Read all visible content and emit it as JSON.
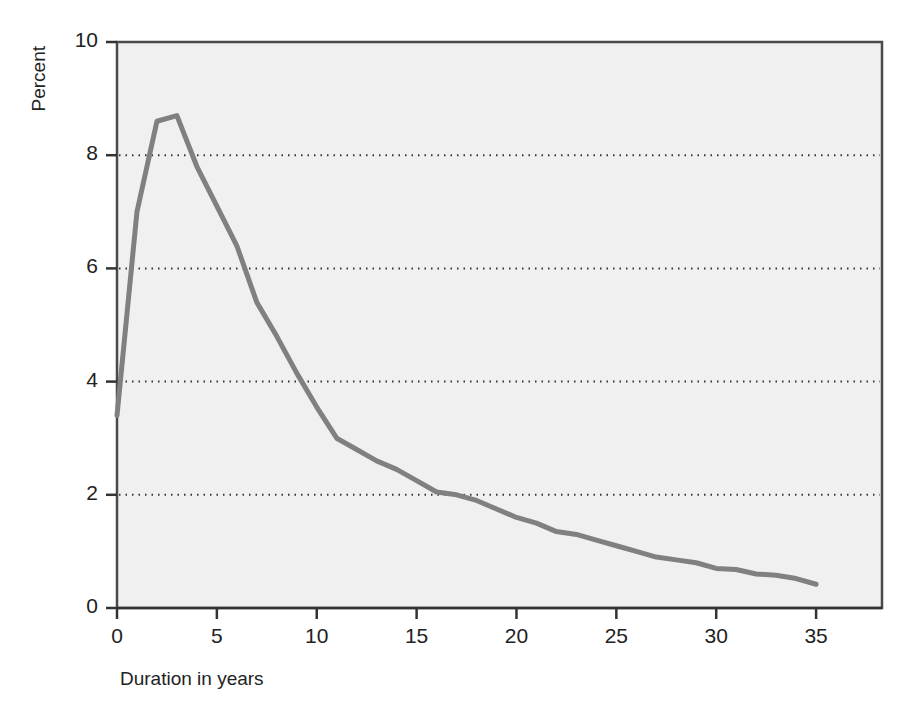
{
  "chart_data": {
    "type": "line",
    "title": "",
    "subtitle": "",
    "xlabel": "Duration in years",
    "ylabel": "Percent",
    "xlim": [
      0,
      38.3
    ],
    "ylim": [
      0,
      10
    ],
    "xticks": [
      0,
      5,
      10,
      15,
      20,
      25,
      30,
      35
    ],
    "xtick_labels": [
      "0",
      "5",
      "10",
      "15",
      "20",
      "25",
      "30",
      "35"
    ],
    "yticks": [
      0,
      2,
      4,
      6,
      8,
      10
    ],
    "ytick_labels": [
      "0",
      "2",
      "4",
      "6",
      "8",
      "10"
    ],
    "gridlines_y": [
      2,
      4,
      6,
      8
    ],
    "grid": "horizontal-dotted",
    "legend": "none",
    "plot_background": "#f0f0f0",
    "line_color": "#808080",
    "line_width": 5,
    "frame_color": "#4a4a4a",
    "x": [
      0,
      1,
      2,
      3,
      4,
      5,
      6,
      7,
      8,
      9,
      10,
      11,
      12,
      13,
      14,
      15,
      16,
      17,
      18,
      19,
      20,
      21,
      22,
      23,
      24,
      25,
      26,
      27,
      28,
      29,
      30,
      31,
      32,
      33,
      34,
      35
    ],
    "values": [
      3.4,
      7.0,
      8.6,
      8.7,
      7.8,
      7.1,
      6.4,
      5.4,
      4.8,
      4.15,
      3.55,
      3.0,
      2.8,
      2.6,
      2.45,
      2.25,
      2.05,
      2.0,
      1.9,
      1.75,
      1.6,
      1.5,
      1.35,
      1.3,
      1.2,
      1.1,
      1.0,
      0.9,
      0.85,
      0.8,
      0.7,
      0.68,
      0.6,
      0.58,
      0.52,
      0.42
    ],
    "series_name": "Percent by duration"
  },
  "axes": {
    "y_title": "Percent",
    "x_title": "Duration in years"
  }
}
